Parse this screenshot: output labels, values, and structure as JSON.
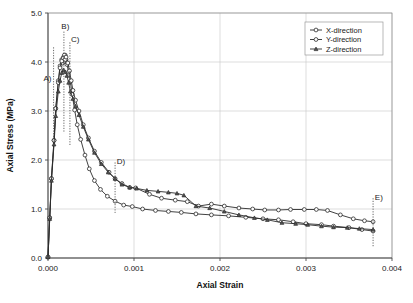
{
  "chart_data": {
    "type": "line",
    "title": "",
    "xlabel": "Axial Strain",
    "ylabel": "Axial Stress (MPa)",
    "xlim": [
      0.0,
      0.004
    ],
    "ylim": [
      0.0,
      5.0
    ],
    "grid": true,
    "legend_position": "top-right",
    "xticks": [
      "0.000",
      "0.001",
      "0.002",
      "0.003",
      "0.004"
    ],
    "xtick_values": [
      0.0,
      0.001,
      0.002,
      0.003,
      0.004
    ],
    "yticks": [
      "0.0",
      "1.0",
      "2.0",
      "3.0",
      "4.0",
      "5.0"
    ],
    "ytick_values": [
      0.0,
      1.0,
      2.0,
      3.0,
      4.0,
      5.0
    ],
    "series": [
      {
        "name": "X-direction",
        "marker": "open-circle",
        "x": [
          0.0,
          2e-05,
          4e-05,
          7e-05,
          9e-05,
          0.00012,
          0.00014,
          0.00016,
          0.00017,
          0.00018,
          0.00019,
          0.0002,
          0.00021,
          0.00022,
          0.00024,
          0.00026,
          0.00028,
          0.00031,
          0.00034,
          0.00038,
          0.00043,
          0.00048,
          0.00054,
          0.00061,
          0.00069,
          0.00078,
          0.00088,
          0.00098,
          0.0011,
          0.00125,
          0.0014,
          0.00155,
          0.00172,
          0.0019,
          0.0021,
          0.0023,
          0.0025,
          0.00268,
          0.00285,
          0.003,
          0.00318,
          0.00332,
          0.0035,
          0.00365,
          0.00378
        ],
        "y": [
          0.02,
          0.82,
          1.62,
          2.4,
          3.05,
          3.62,
          3.92,
          4.05,
          3.98,
          4.1,
          4.02,
          4.14,
          4.05,
          3.95,
          3.8,
          3.6,
          3.34,
          3.02,
          2.72,
          2.42,
          2.1,
          1.82,
          1.58,
          1.4,
          1.26,
          1.16,
          1.08,
          1.05,
          1.0,
          0.97,
          0.95,
          0.93,
          0.9,
          0.88,
          0.86,
          0.83,
          0.8,
          0.78,
          0.74,
          0.7,
          0.68,
          0.65,
          0.62,
          0.58,
          0.55
        ]
      },
      {
        "name": "Y-direction",
        "marker": "open-circle",
        "x": [
          0.0,
          2e-05,
          4e-05,
          7e-05,
          9e-05,
          0.00012,
          0.00014,
          0.00016,
          0.00018,
          0.00019,
          0.0002,
          0.00021,
          0.00023,
          0.00025,
          0.00027,
          0.00029,
          0.00032,
          0.00036,
          0.00041,
          0.00047,
          0.00054,
          0.00062,
          0.00071,
          0.00078,
          0.00086,
          0.00095,
          0.00102,
          0.00118,
          0.00132,
          0.00148,
          0.00162,
          0.00175,
          0.0019,
          0.00205,
          0.00222,
          0.00238,
          0.00252,
          0.00268,
          0.00282,
          0.00298,
          0.00312,
          0.00325,
          0.0034,
          0.00355,
          0.00368,
          0.00378
        ],
        "y": [
          0.02,
          0.82,
          1.62,
          2.4,
          3.05,
          3.58,
          3.88,
          4.02,
          4.08,
          4.14,
          4.05,
          4.1,
          3.98,
          3.82,
          3.62,
          3.42,
          3.22,
          3.0,
          2.72,
          2.45,
          2.18,
          1.95,
          1.75,
          1.62,
          1.52,
          1.44,
          1.43,
          1.3,
          1.22,
          1.18,
          1.15,
          1.06,
          1.1,
          1.06,
          1.02,
          1.0,
          0.98,
          0.98,
          0.99,
          0.99,
          0.99,
          0.97,
          0.88,
          0.8,
          0.76,
          0.74
        ]
      },
      {
        "name": "Z-direction",
        "marker": "filled-triangle",
        "x": [
          0.0,
          2e-05,
          4e-05,
          7e-05,
          9e-05,
          0.00012,
          0.00014,
          0.00016,
          0.00018,
          0.0002,
          0.00022,
          0.00024,
          0.00026,
          0.00029,
          0.00032,
          0.00036,
          0.00041,
          0.00047,
          0.00054,
          0.00062,
          0.0007,
          0.00078,
          0.00086,
          0.00095,
          0.00103,
          0.00115,
          0.00128,
          0.0014,
          0.0015,
          0.00158,
          0.00172,
          0.00188,
          0.00205,
          0.00222,
          0.0024,
          0.00255,
          0.00272,
          0.00288,
          0.00302,
          0.00318,
          0.00332,
          0.00348,
          0.00362,
          0.00378
        ],
        "y": [
          0.02,
          0.8,
          1.58,
          2.32,
          2.9,
          3.4,
          3.62,
          3.78,
          3.84,
          3.8,
          3.72,
          3.58,
          3.4,
          3.25,
          3.1,
          2.92,
          2.68,
          2.42,
          2.15,
          1.92,
          1.75,
          1.62,
          1.5,
          1.44,
          1.42,
          1.38,
          1.36,
          1.34,
          1.32,
          1.28,
          1.06,
          1.02,
          0.95,
          0.88,
          0.82,
          0.78,
          0.72,
          0.7,
          0.68,
          0.65,
          0.63,
          0.62,
          0.6,
          0.58
        ]
      }
    ],
    "annotations": [
      {
        "label": "A)",
        "x": 6.5e-05,
        "y_top": 4.3,
        "y_bottom": 2.45,
        "label_x": 4e-05,
        "label_y": 3.62,
        "has_line": true
      },
      {
        "label": "B)",
        "x": 0.000185,
        "y_top": 4.62,
        "y_bottom": 2.55,
        "label_x": 0.000155,
        "label_y": 4.68,
        "has_line": true
      },
      {
        "label": "C)",
        "x": 0.000255,
        "y_top": 4.4,
        "y_bottom": 2.3,
        "label_x": 0.000268,
        "label_y": 4.4,
        "has_line": true
      },
      {
        "label": "D)",
        "x": 0.00078,
        "y_top": 1.95,
        "y_bottom": 0.92,
        "label_x": 0.0008,
        "label_y": 1.92,
        "has_line": true
      },
      {
        "label": "E)",
        "x": 0.00378,
        "y_top": 1.22,
        "y_bottom": 0.24,
        "label_x": 0.0038,
        "label_y": 1.18,
        "has_line": true
      }
    ]
  }
}
